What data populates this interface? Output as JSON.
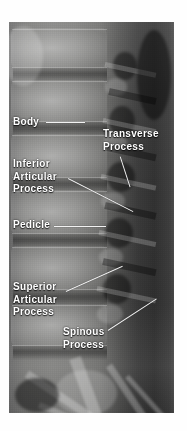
{
  "image": {
    "kind": "xray-radiograph",
    "view": "lateral lumbar spine",
    "alt": "Lateral radiograph of the lumbar spine with anatomical structures labeled in white text"
  },
  "annotations": [
    {
      "id": "body",
      "name": "label-body",
      "lines": [
        "Body"
      ],
      "text": "Body",
      "x": 13,
      "y": 116,
      "leader": {
        "x": 46,
        "y": 122,
        "length": 39,
        "angle": 0
      }
    },
    {
      "id": "transverse-process",
      "name": "label-transverse-process",
      "lines": [
        "Transverse",
        "Process"
      ],
      "text": "Transverse Process",
      "x": 103,
      "y": 128,
      "leader": {
        "x": 120,
        "y": 156,
        "length": 32,
        "angle": 72
      }
    },
    {
      "id": "inferior-articular-process",
      "name": "label-inferior-articular-process",
      "lines": [
        "Inferior",
        "Articular",
        "Process"
      ],
      "text": "Inferior Articular Process",
      "x": 13,
      "y": 158,
      "leader": {
        "x": 68,
        "y": 178,
        "length": 73,
        "angle": 27
      }
    },
    {
      "id": "pedicle",
      "name": "label-pedicle",
      "lines": [
        "Pedicle"
      ],
      "text": "Pedicle",
      "x": 13,
      "y": 219,
      "leader": {
        "x": 54,
        "y": 226,
        "length": 52,
        "angle": 0
      }
    },
    {
      "id": "superior-articular-process",
      "name": "label-superior-articular-process",
      "lines": [
        "Superior",
        "Articular",
        "Process"
      ],
      "text": "Superior Articular Process",
      "x": 13,
      "y": 281,
      "leader": {
        "x": 66,
        "y": 291,
        "length": 62,
        "angle": -24
      }
    },
    {
      "id": "spinous-process",
      "name": "label-spinous-process",
      "lines": [
        "Spinous",
        "Process"
      ],
      "text": "Spinous Process",
      "x": 63,
      "y": 326,
      "leader": {
        "x": 108,
        "y": 330,
        "length": 58,
        "angle": -33
      }
    }
  ],
  "colors": {
    "label_text": "#ffffff",
    "leader_line": "#f2f2f2",
    "page_background": "#fefefe",
    "film_dark": "#313131",
    "film_light": "#828280"
  }
}
